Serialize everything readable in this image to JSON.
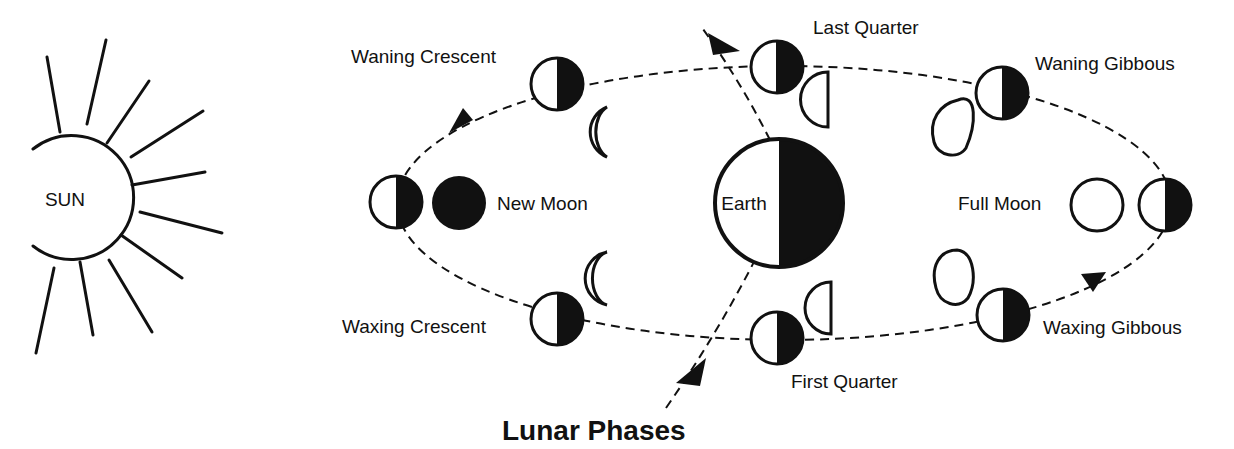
{
  "title": "Lunar Phases",
  "colors": {
    "ink": "#111111",
    "background": "#ffffff"
  },
  "sun": {
    "label": "SUN"
  },
  "earth": {
    "label": "Earth"
  },
  "phases": {
    "new_moon": "New Moon",
    "waxing_crescent": "Waxing Crescent",
    "first_quarter": "First Quarter",
    "waxing_gibbous": "Waxing Gibbous",
    "full_moon": "Full Moon",
    "waning_gibbous": "Waning Gibbous",
    "last_quarter": "Last Quarter",
    "waning_crescent": "Waning Crescent"
  }
}
